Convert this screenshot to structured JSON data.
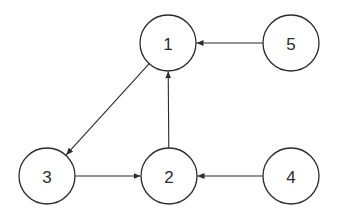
{
  "diagram": {
    "type": "directed-graph",
    "stroke_color": "#2b2b2b",
    "background": "#ffffff",
    "nodes": [
      {
        "id": "1",
        "label": "1",
        "cx": 168,
        "cy": 43,
        "r": 28
      },
      {
        "id": "2",
        "label": "2",
        "cx": 169,
        "cy": 176,
        "r": 28
      },
      {
        "id": "3",
        "label": "3",
        "cx": 47,
        "cy": 176,
        "r": 28
      },
      {
        "id": "4",
        "label": "4",
        "cx": 291,
        "cy": 176,
        "r": 28
      },
      {
        "id": "5",
        "label": "5",
        "cx": 291,
        "cy": 43,
        "r": 28
      }
    ],
    "edges": [
      {
        "from": "5",
        "to": "1"
      },
      {
        "from": "2",
        "to": "1"
      },
      {
        "from": "1",
        "to": "3"
      },
      {
        "from": "3",
        "to": "2"
      },
      {
        "from": "4",
        "to": "2"
      }
    ]
  }
}
